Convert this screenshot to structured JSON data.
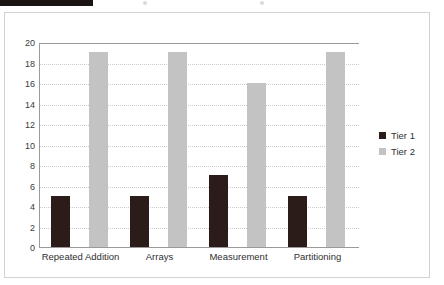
{
  "redaction": {
    "present": true,
    "color": "#1a1412"
  },
  "chart_data": {
    "type": "bar",
    "title": "",
    "subtitle": "",
    "xlabel": "",
    "ylabel": "",
    "categories": [
      "Repeated Addition",
      "Arrays",
      "Measurement",
      "Partitioning"
    ],
    "series": [
      {
        "name": "Tier 1",
        "color": "#2b1c1a",
        "values": [
          5,
          5,
          7,
          5
        ]
      },
      {
        "name": "Tier 2",
        "color": "#c3c3c3",
        "values": [
          19,
          19,
          16,
          19
        ]
      }
    ],
    "ylim": [
      0,
      20
    ],
    "ytick_step": 2,
    "yticks": [
      20,
      18,
      16,
      14,
      12,
      10,
      8,
      6,
      4,
      2,
      0
    ],
    "grid": true,
    "grid_axis": "y",
    "grid_style": "dotted",
    "legend": {
      "position": "right",
      "entries": [
        {
          "label": "Tier 1",
          "color": "#2b1c1a"
        },
        {
          "label": "Tier 2",
          "color": "#c3c3c3"
        }
      ]
    }
  },
  "colors": {
    "tier1": "#2b1c1a",
    "tier2": "#c3c3c3",
    "axis": "#9a9a9a",
    "grid": "#cccccc",
    "frame": "#d2d2d2",
    "background": "#ffffff"
  }
}
